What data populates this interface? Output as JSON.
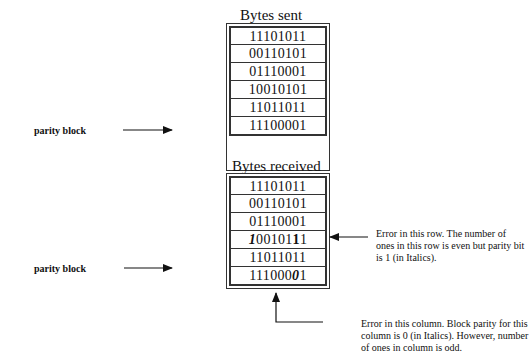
{
  "sent": {
    "title": "Bytes sent",
    "rows": [
      "11101011",
      "00110101",
      "01110001",
      "10010101",
      "11011011",
      "11100001"
    ]
  },
  "received": {
    "title": "Bytes received",
    "rows": [
      "11101011",
      "00110101",
      "01110001",
      "10010111",
      "11011011",
      "11100001"
    ],
    "row4_parts": [
      "1",
      "00101",
      "1",
      "1"
    ],
    "row6_parts": [
      "111000",
      "0",
      "1"
    ]
  },
  "labels": {
    "parity_block_top": "parity block",
    "parity_block_bottom": "parity block"
  },
  "notes": {
    "row_error": "Error in this row.  The number of ones in this row is even but parity bit is 1 (in Italics).",
    "column_error": "Error in this column.  Block parity for this column is 0 (in Italics).  However, number of ones in column is odd."
  }
}
